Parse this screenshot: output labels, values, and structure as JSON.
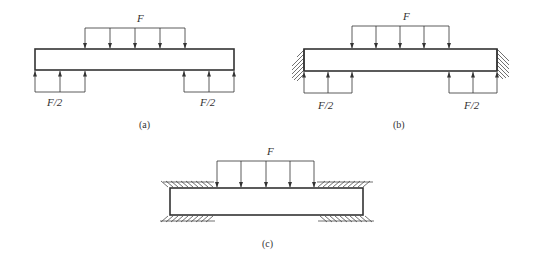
{
  "figures": [
    {
      "id": "a",
      "caption": "(a)",
      "description": "Beam with distributed load F on top, two F/2 distributed reactions on bottom at both ends",
      "top_load_label": "F",
      "left_reaction_label": "F/2",
      "right_reaction_label": "F/2",
      "supports": "none"
    },
    {
      "id": "b",
      "caption": "(b)",
      "description": "Beam with distributed load F on top, two F/2 reactions on bottom, fixed walls at both ends",
      "top_load_label": "F",
      "left_reaction_label": "F/2",
      "right_reaction_label": "F/2",
      "supports": "fixed walls at left and right ends"
    },
    {
      "id": "c",
      "caption": "(c)",
      "description": "Beam with distributed load F on top, clamped between hatched surfaces above and below at both ends",
      "top_load_label": "F",
      "supports": "clamped top and bottom at both ends"
    }
  ],
  "colors": {
    "line": "#333333",
    "background": "#ffffff"
  }
}
